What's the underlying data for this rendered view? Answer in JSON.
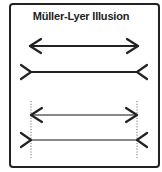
{
  "title": "Müller-Lyer Illusion",
  "colors": {
    "primary": "#222222",
    "comparison": "#888888",
    "guide": "#555555",
    "frame": "#222222"
  },
  "figures": [
    {
      "name": "outward-arrowheads",
      "style": "black",
      "y": 46,
      "x1": 30,
      "x2": 138
    },
    {
      "name": "inward-fins",
      "style": "black",
      "y": 72,
      "x1": 31,
      "x2": 137
    },
    {
      "name": "outward-arrowheads-comparison",
      "style": "gray",
      "y": 115,
      "x1": 31,
      "x2": 137
    },
    {
      "name": "inward-fins-comparison",
      "style": "gray",
      "y": 140,
      "x1": 31,
      "x2": 137
    }
  ],
  "guides": [
    {
      "x": 31
    },
    {
      "x": 137
    }
  ]
}
